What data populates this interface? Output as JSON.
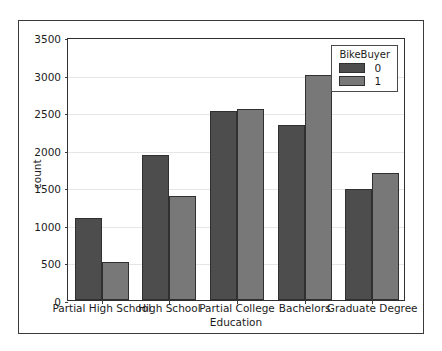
{
  "chart_data": {
    "type": "bar",
    "title": "",
    "xlabel": "Education",
    "ylabel": "count",
    "categories": [
      "Partial High School",
      "High School",
      "Partial College",
      "Bachelors",
      "Graduate Degree"
    ],
    "series": [
      {
        "name": "0",
        "values": [
          1090,
          1930,
          2515,
          2330,
          1480
        ],
        "color": "#4d4d4d"
      },
      {
        "name": "1",
        "values": [
          500,
          1385,
          2540,
          3000,
          1690
        ],
        "color": "#787878"
      }
    ],
    "ylim": [
      0,
      3500
    ],
    "yticks": [
      0,
      500,
      1000,
      1500,
      2000,
      2500,
      3000,
      3500
    ],
    "ytick_labels": [
      "0",
      "500",
      "1000",
      "1500",
      "2000",
      "2500",
      "3000",
      "3500"
    ],
    "grid": true,
    "legend": {
      "title": "BikeBuyer",
      "position": "upper right",
      "entries": [
        "0",
        "1"
      ]
    }
  }
}
